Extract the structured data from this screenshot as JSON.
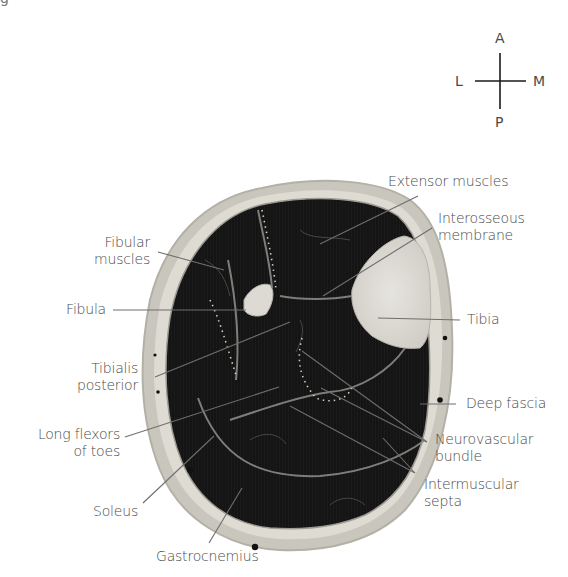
{
  "figure": {
    "top_clipped_text": "g",
    "compass": {
      "anterior": "A",
      "posterior": "P",
      "lateral": "L",
      "medial": "M"
    },
    "labels": {
      "extensor_muscles": [
        "Extensor muscles"
      ],
      "interosseous_membrane": [
        "Interosseous",
        "membrane"
      ],
      "fibular_muscles": [
        "Fibular",
        "muscles"
      ],
      "fibula": [
        "Fibula"
      ],
      "tibia": [
        "Tibia"
      ],
      "tibialis_posterior": [
        "Tibialis",
        "posterior"
      ],
      "deep_fascia": [
        "Deep fascia"
      ],
      "long_flexors_of_toes": [
        "Long flexors",
        "of toes"
      ],
      "neurovascular_bundle": [
        "Neurovascular",
        "bundle"
      ],
      "soleus": [
        "Soleus"
      ],
      "intermuscular_septa": [
        "Intermuscular",
        "septa"
      ],
      "gastrocnemius": [
        "Gastrocnemius"
      ]
    },
    "colors": {
      "label_text": "#4a4a4a",
      "leader_line": "#6e6e6e",
      "skin_ring": "#c9c6bd",
      "muscle": "#141414",
      "bone": "#dcdad3",
      "septa": "#8a8a84",
      "background": "#ffffff"
    }
  }
}
